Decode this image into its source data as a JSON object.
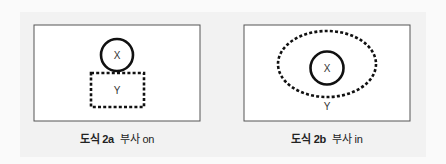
{
  "figures": [
    {
      "id": "2a",
      "caption_label": "도식 2a",
      "caption_text": "부사 on",
      "circle_label": "X",
      "dashed_label": "Y",
      "dashed_shape": "rectangle",
      "relation": "X sits on top of Y"
    },
    {
      "id": "2b",
      "caption_label": "도식 2b",
      "caption_text": "부사 in",
      "circle_label": "X",
      "dashed_label": "Y",
      "dashed_shape": "ellipse",
      "relation": "X is inside Y"
    }
  ],
  "colors": {
    "stroke": "#111111",
    "frame": "#555555",
    "panel_bg": "#ffffff",
    "page_bg": "#f2f2f2"
  }
}
